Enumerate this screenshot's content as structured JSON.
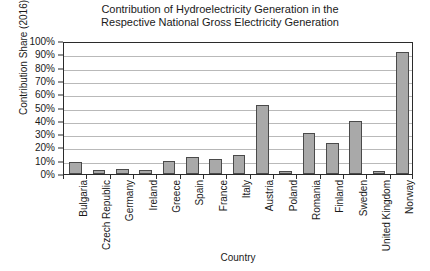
{
  "chart_data": {
    "type": "bar",
    "title": "Contribution of Hydroelectricity Generation in the Respective National Gross Electricity Generation",
    "title_lines": [
      "Contribution of Hydroelectricity Generation in the",
      "Respective National Gross Electricity Generation"
    ],
    "xlabel": "Country",
    "ylabel": "Contribution Share (2016)",
    "categories": [
      "Bulgaria",
      "Czech Republic",
      "Germany",
      "Ireland",
      "Greece",
      "Spain",
      "France",
      "Italy",
      "Austria",
      "Poland",
      "Romania",
      "Finland",
      "Sweden",
      "United Kingdom",
      "Norway"
    ],
    "values": [
      9,
      3,
      4,
      3,
      10,
      13,
      11,
      14,
      52,
      2,
      31,
      23,
      40,
      2,
      92
    ],
    "ylim": [
      0,
      100
    ],
    "yticks": [
      0,
      10,
      20,
      30,
      40,
      50,
      60,
      70,
      80,
      90,
      100
    ],
    "ytick_labels": [
      "0%",
      "10%",
      "20%",
      "30%",
      "40%",
      "50%",
      "60%",
      "70%",
      "80%",
      "90%",
      "100%"
    ],
    "grid": true,
    "legend": false,
    "bar_color": "#a9a9a9",
    "bar_border_color": "#4a4a4a",
    "gridline_color": "#b9b9b9",
    "axis_color": "#2b2b2b"
  }
}
